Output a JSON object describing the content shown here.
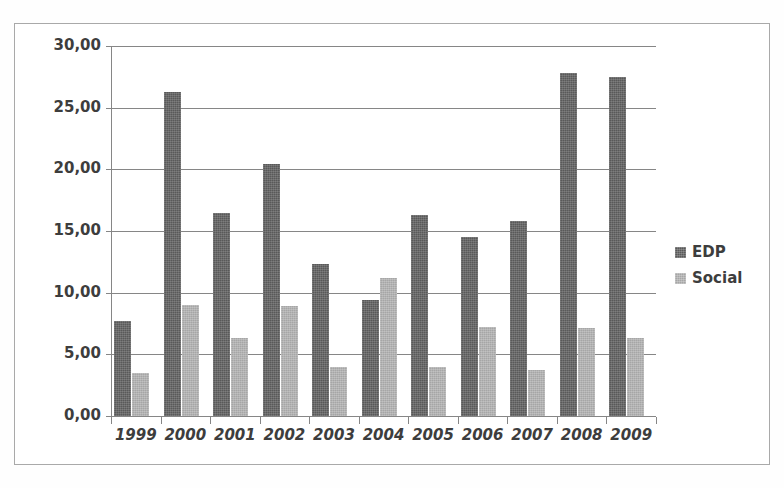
{
  "chart_data": {
    "type": "bar",
    "title": "",
    "subtitle": "",
    "xlabel": "",
    "ylabel": "",
    "categories": [
      "1999",
      "2000",
      "2001",
      "2002",
      "2003",
      "2004",
      "2005",
      "2006",
      "2007",
      "2008",
      "2009"
    ],
    "series": [
      {
        "name": "EDP",
        "color": "#595959",
        "values": [
          7.7,
          26.3,
          16.5,
          20.4,
          12.3,
          9.4,
          16.3,
          14.5,
          15.8,
          27.8,
          27.5
        ]
      },
      {
        "name": "Social",
        "color": "#a6a6a6",
        "values": [
          3.5,
          9.0,
          6.3,
          8.9,
          4.0,
          11.2,
          4.0,
          7.2,
          3.7,
          7.1,
          6.3
        ]
      }
    ],
    "ylim": [
      0,
      30
    ],
    "ytick_values": [
      0,
      5,
      10,
      15,
      20,
      25,
      30
    ],
    "ytick_labels": [
      "0,00",
      "5,00",
      "10,00",
      "15,00",
      "20,00",
      "25,00",
      "30,00"
    ],
    "grid": true,
    "grid_axis": "y",
    "legend_position": "right",
    "decimal_separator": ","
  },
  "legend": {
    "entries": [
      {
        "label": "EDP"
      },
      {
        "label": "Social"
      }
    ]
  }
}
